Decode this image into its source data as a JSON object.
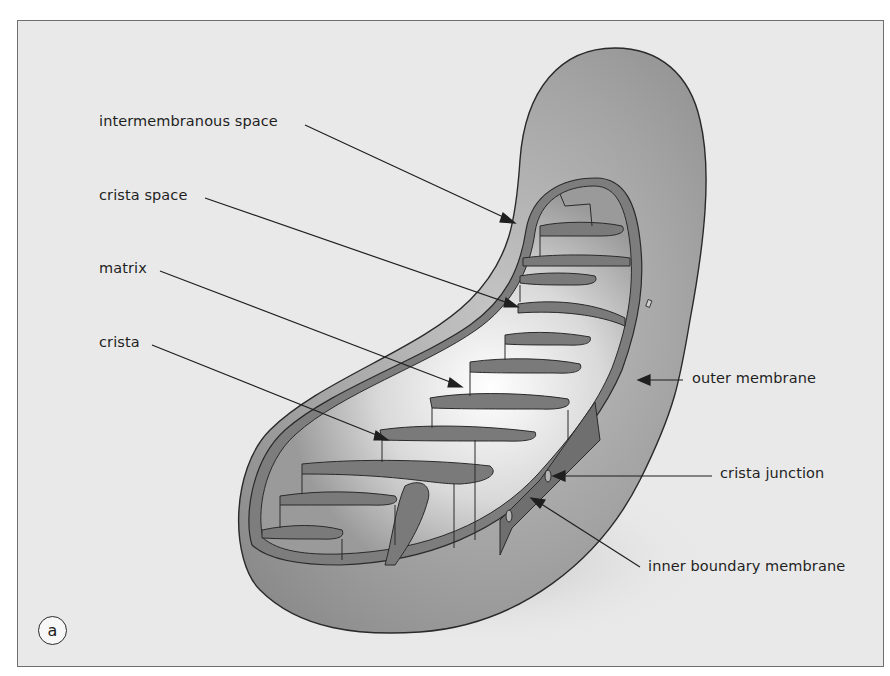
{
  "figure": {
    "panel_label": "a"
  },
  "labels": {
    "intermembranous_space": "intermembranous space",
    "crista_space": "crista space",
    "matrix": "matrix",
    "crista": "crista",
    "outer_membrane": "outer membrane",
    "crista_junction": "crista junction",
    "inner_boundary_membrane": "inner boundary membrane"
  },
  "colors": {
    "background": "#e9e9e9",
    "frame_border": "#6e6e6e",
    "outer_shell": "#a8a8a8",
    "membrane_band": "#7d7d7d",
    "matrix_light": "#f2f2f2",
    "line": "#1f1f1f"
  }
}
